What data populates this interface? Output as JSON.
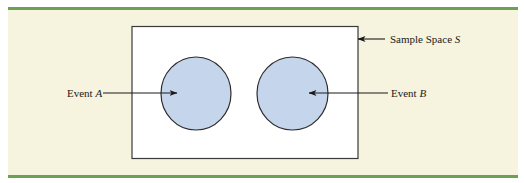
{
  "figure": {
    "colors": {
      "panel_background": "#f6f3de",
      "rule_green": "#6aa251",
      "sample_space_fill": "#ffffff",
      "sample_space_stroke": "#3a3a3a",
      "event_fill": "#c5d6ec",
      "event_stroke": "#2e2e2e",
      "arrow": "#1a1a1a"
    },
    "sample_space": {
      "label_prefix": "Sample Space ",
      "label_var": "S"
    },
    "events": [
      {
        "id": "A",
        "label_prefix": "Event ",
        "label_var": "A"
      },
      {
        "id": "B",
        "label_prefix": "Event ",
        "label_var": "B"
      }
    ]
  }
}
